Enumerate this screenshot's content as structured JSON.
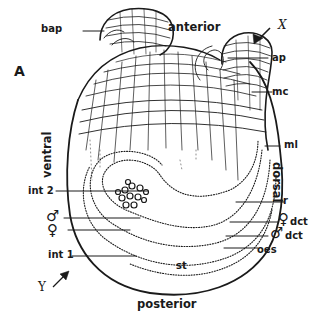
{
  "figure": {
    "panel_label": "A",
    "orientation": {
      "anterior": "anterior",
      "posterior": "posterior",
      "ventral": "ventral",
      "dorsal": "dorsal"
    },
    "view_arrows": {
      "x": "X",
      "y": "Y"
    },
    "labels": {
      "bap": "bap",
      "ap": "ap",
      "mc": "mc",
      "ml": "ml",
      "int2": "int 2",
      "male_symbol": "♂",
      "female_symbol": "♀",
      "int1": "int 1",
      "r": "r",
      "female_dct_symbol": "♀",
      "female_dct": "dct",
      "male_dct_symbol": "♂",
      "male_dct": "dct",
      "oes": "oes",
      "st": "st"
    },
    "colors": {
      "ink": "#1a1a1a",
      "background": "#ffffff"
    }
  }
}
